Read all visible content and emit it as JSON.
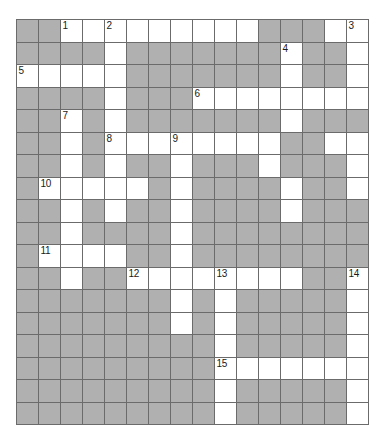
{
  "puzzle": {
    "type": "crossword-grid",
    "rows": 18,
    "cols": 16,
    "colors": {
      "block": "#b0b0b0",
      "open": "#ffffff",
      "grid_line": "#6b6b6b",
      "number_text": "#1a1a1a",
      "page_background": "#ffffff"
    },
    "legend": {
      "0": "open cell (white)",
      "1": "blocked cell (gray)"
    },
    "grid": [
      [
        1,
        1,
        0,
        0,
        0,
        0,
        0,
        0,
        0,
        0,
        0,
        1,
        1,
        1,
        0,
        0
      ],
      [
        1,
        1,
        1,
        1,
        0,
        1,
        1,
        1,
        1,
        1,
        1,
        1,
        0,
        1,
        1,
        0
      ],
      [
        0,
        0,
        0,
        0,
        0,
        1,
        1,
        1,
        1,
        1,
        1,
        1,
        0,
        1,
        1,
        0
      ],
      [
        1,
        1,
        1,
        1,
        0,
        1,
        1,
        1,
        0,
        0,
        0,
        0,
        0,
        0,
        0,
        0
      ],
      [
        1,
        1,
        0,
        1,
        0,
        1,
        1,
        1,
        1,
        1,
        1,
        1,
        0,
        1,
        1,
        1
      ],
      [
        1,
        1,
        0,
        1,
        0,
        0,
        0,
        0,
        0,
        0,
        0,
        0,
        1,
        1,
        0,
        0
      ],
      [
        1,
        1,
        0,
        1,
        0,
        1,
        1,
        0,
        1,
        1,
        1,
        0,
        1,
        1,
        1,
        0
      ],
      [
        1,
        0,
        0,
        0,
        0,
        0,
        1,
        0,
        1,
        1,
        1,
        1,
        0,
        1,
        1,
        0
      ],
      [
        1,
        1,
        0,
        1,
        0,
        1,
        1,
        0,
        1,
        1,
        1,
        1,
        0,
        1,
        1,
        1
      ],
      [
        1,
        1,
        0,
        1,
        1,
        1,
        1,
        0,
        1,
        1,
        1,
        1,
        1,
        1,
        1,
        1
      ],
      [
        1,
        0,
        0,
        0,
        0,
        1,
        1,
        0,
        1,
        1,
        1,
        1,
        1,
        1,
        1,
        1
      ],
      [
        1,
        1,
        0,
        1,
        1,
        0,
        0,
        0,
        0,
        0,
        0,
        0,
        0,
        1,
        1,
        0
      ],
      [
        1,
        1,
        1,
        1,
        1,
        1,
        1,
        0,
        1,
        0,
        1,
        1,
        1,
        1,
        1,
        0
      ],
      [
        1,
        1,
        1,
        1,
        1,
        1,
        1,
        0,
        1,
        0,
        1,
        1,
        1,
        1,
        1,
        0
      ],
      [
        1,
        1,
        1,
        1,
        1,
        1,
        1,
        1,
        1,
        0,
        1,
        1,
        1,
        1,
        1,
        0
      ],
      [
        1,
        1,
        1,
        1,
        1,
        1,
        1,
        1,
        1,
        0,
        0,
        0,
        0,
        0,
        0,
        0
      ],
      [
        1,
        1,
        1,
        1,
        1,
        1,
        1,
        1,
        1,
        0,
        1,
        1,
        1,
        1,
        1,
        0
      ],
      [
        1,
        1,
        1,
        1,
        1,
        1,
        1,
        1,
        1,
        0,
        1,
        1,
        1,
        1,
        1,
        0
      ]
    ],
    "numbers": [
      {
        "row": 0,
        "col": 2,
        "label": "1"
      },
      {
        "row": 0,
        "col": 4,
        "label": "2"
      },
      {
        "row": 0,
        "col": 15,
        "label": "3"
      },
      {
        "row": 1,
        "col": 12,
        "label": "4"
      },
      {
        "row": 2,
        "col": 0,
        "label": "5"
      },
      {
        "row": 3,
        "col": 8,
        "label": "6"
      },
      {
        "row": 4,
        "col": 2,
        "label": "7"
      },
      {
        "row": 5,
        "col": 4,
        "label": "8"
      },
      {
        "row": 5,
        "col": 7,
        "label": "9"
      },
      {
        "row": 7,
        "col": 1,
        "label": "10"
      },
      {
        "row": 10,
        "col": 1,
        "label": "11"
      },
      {
        "row": 11,
        "col": 5,
        "label": "12"
      },
      {
        "row": 11,
        "col": 9,
        "label": "13"
      },
      {
        "row": 11,
        "col": 15,
        "label": "14"
      },
      {
        "row": 15,
        "col": 9,
        "label": "15"
      }
    ]
  }
}
